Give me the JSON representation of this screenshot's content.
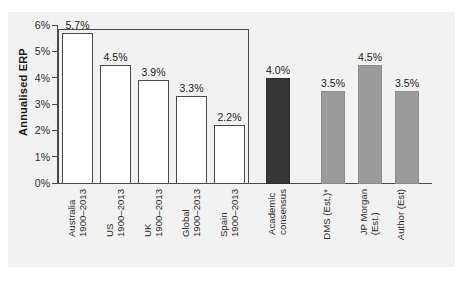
{
  "chart_data": {
    "type": "bar",
    "title": "",
    "subtitle": "",
    "xlabel": "",
    "ylabel": "Annualised ERP",
    "ylim": [
      0,
      6
    ],
    "ytick_values": [
      0,
      1,
      2,
      3,
      4,
      5,
      6
    ],
    "ytick_labels": [
      "0%",
      "1%",
      "2%",
      "3%",
      "4%",
      "5%",
      "6%"
    ],
    "grid": false,
    "legend": "none",
    "value_labels": true,
    "categories": [
      "Australia 1900–2013",
      "US 1900–2013",
      "UK 1900–2013",
      "Global 1900–2013",
      "Spain 1900–2013",
      "Academic consensus",
      "DMS (Est.)*",
      "JP Morgan (Est.)",
      "Author (Est)"
    ],
    "values": [
      5.7,
      4.5,
      3.9,
      3.3,
      2.2,
      4.0,
      3.5,
      4.5,
      3.5
    ],
    "value_label_texts": [
      "5.7%",
      "4.5%",
      "3.9%",
      "3.3%",
      "2.2%",
      "4.0%",
      "3.5%",
      "4.5%",
      "3.5%"
    ],
    "bar_styles": [
      "white",
      "white",
      "white",
      "white",
      "white",
      "dark",
      "grey",
      "grey",
      "grey"
    ],
    "colors": {
      "white_bar_fill": "#ffffff",
      "white_bar_edge": "#4a4a4a",
      "grey_bar_fill": "#9b9b9b",
      "dark_bar_fill": "#373737",
      "axis": "#4a4a4a",
      "text": "#1a1a1a",
      "panel_background": "#f2f2f2",
      "figure_background": "#ffffff"
    },
    "bars": [
      {
        "label_line1": "Australia",
        "label_line2": "1900–2013",
        "value": 5.7,
        "value_text": "5.7%",
        "style": "white"
      },
      {
        "label_line1": "US",
        "label_line2": "1900–2013",
        "value": 4.5,
        "value_text": "4.5%",
        "style": "white"
      },
      {
        "label_line1": "UK",
        "label_line2": "1900–2013",
        "value": 3.9,
        "value_text": "3.9%",
        "style": "white"
      },
      {
        "label_line1": "Global",
        "label_line2": "1900–2013",
        "value": 3.3,
        "value_text": "3.3%",
        "style": "white"
      },
      {
        "label_line1": "Spain",
        "label_line2": "1900–2013",
        "value": 2.2,
        "value_text": "2.2%",
        "style": "white"
      },
      {
        "label_line1": "Academic",
        "label_line2": "consensus",
        "value": 4.0,
        "value_text": "4.0%",
        "style": "dark"
      },
      {
        "label_line1": "DMS (Est.)*",
        "label_line2": "",
        "value": 3.5,
        "value_text": "3.5%",
        "style": "grey"
      },
      {
        "label_line1": "JP Morgan",
        "label_line2": "(Est.)",
        "value": 4.5,
        "value_text": "4.5%",
        "style": "grey"
      },
      {
        "label_line1": "Author (Est)",
        "label_line2": "",
        "value": 3.5,
        "value_text": "3.5%",
        "style": "grey"
      }
    ]
  }
}
